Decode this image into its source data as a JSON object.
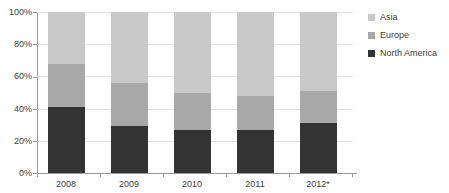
{
  "chart_data": {
    "type": "bar",
    "subtype": "100% stacked bar",
    "title": "",
    "xlabel": "",
    "ylabel": "",
    "categories": [
      "2008",
      "2009",
      "2010",
      "2011",
      "2012*"
    ],
    "series": [
      {
        "name": "North America",
        "color": "#333333",
        "values": [
          41,
          29,
          27,
          27,
          31
        ]
      },
      {
        "name": "Europe",
        "color": "#a8a8a8",
        "values": [
          27,
          27,
          23,
          21,
          20
        ]
      },
      {
        "name": "Asia",
        "color": "#c9c9c9",
        "values": [
          32,
          44,
          50,
          52,
          49
        ]
      }
    ],
    "stack_order_bottom_to_top": [
      "North America",
      "Europe",
      "Asia"
    ],
    "ylim": [
      0,
      100
    ],
    "yticks": [
      0,
      20,
      40,
      60,
      80,
      100
    ],
    "ytick_labels": [
      "0%",
      "20%",
      "40%",
      "60%",
      "80%",
      "100%"
    ],
    "grid": true,
    "legend_position": "right",
    "legend_order_top_to_bottom": [
      "Asia",
      "Europe",
      "North America"
    ],
    "footnote_marker": "*"
  },
  "axis": {
    "y_labels": [
      "100%",
      "80%",
      "60%",
      "40%",
      "20%",
      "0%"
    ],
    "x_labels": [
      "2008",
      "2009",
      "2010",
      "2011",
      "2012*"
    ]
  },
  "legend": {
    "items": [
      {
        "label": "Asia",
        "color": "#c9c9c9"
      },
      {
        "label": "Europe",
        "color": "#a8a8a8"
      },
      {
        "label": "North America",
        "color": "#333333"
      }
    ]
  },
  "colors": {
    "asia": "#c9c9c9",
    "europe": "#a8a8a8",
    "north_america": "#333333",
    "axis": "#9a9a9a",
    "grid": "#e3e3e3",
    "text": "#404040",
    "background": "#ffffff"
  }
}
